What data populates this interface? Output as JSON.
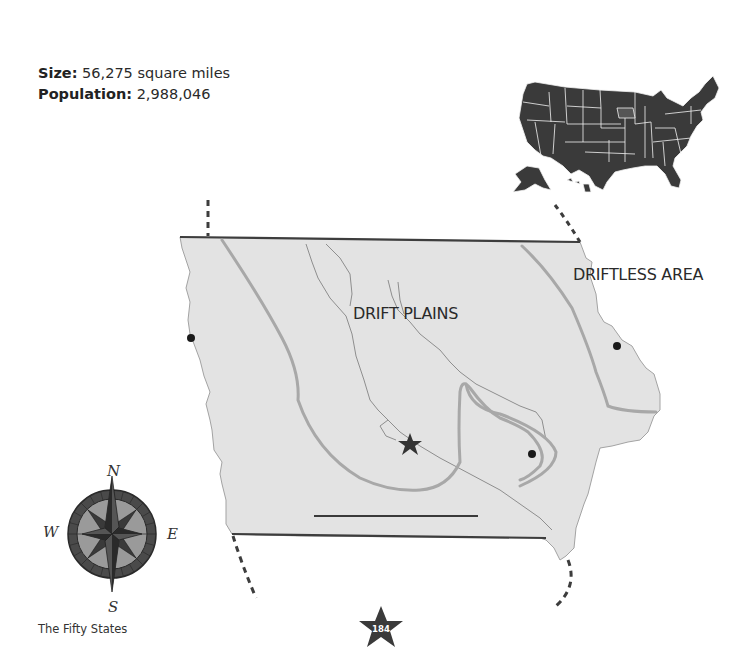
{
  "state_facts": {
    "size_label": "Size:",
    "size_value": "56,275 square miles",
    "population_label": "Population:",
    "population_value": "2,988,046"
  },
  "locator_map": {
    "icon": "usa-map-icon",
    "highlighted_state": "Iowa"
  },
  "state_map": {
    "regions": [
      {
        "label": "DRIFT PLAINS"
      },
      {
        "label": "DRIFTLESS AREA"
      }
    ],
    "capital_symbol": "star",
    "city_markers": 4,
    "land_color": "#e3e3e3",
    "border_color": "#3d3d3d",
    "region_line_color": "#a6a6a6"
  },
  "compass": {
    "north": "N",
    "south": "S",
    "east": "E",
    "west": "W"
  },
  "footer": {
    "book_title": "The Fifty States",
    "page_number": "184"
  }
}
